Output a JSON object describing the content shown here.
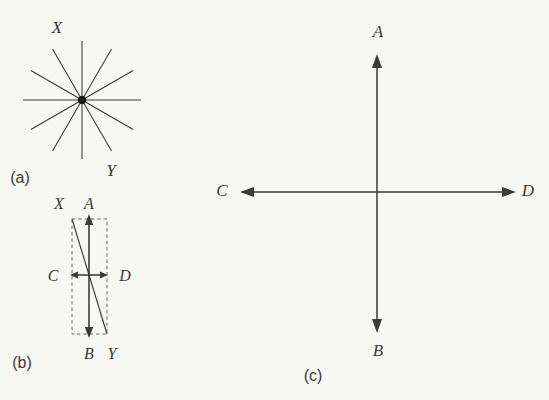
{
  "figure": {
    "width": 549,
    "height": 400,
    "background_color": "#f7f7f4",
    "ink_color": "#3a3a3a",
    "guide_color": "#6b6b6b",
    "hub_color": "#1c1c1c"
  },
  "panels": {
    "a": {
      "caption": "(a)",
      "caption_pos": {
        "x": 20,
        "y": 179
      },
      "type": "radial-starburst",
      "center": {
        "x": 82,
        "y": 100
      },
      "radius": 59,
      "ray_count": 12,
      "ray_angles_deg": [
        0,
        30,
        60,
        90,
        120,
        150,
        180,
        210,
        240,
        270,
        300,
        330
      ],
      "stroke_width": 1.05,
      "hub_radius": 4.2,
      "labels": [
        {
          "name": "X",
          "text": "X",
          "x": 57,
          "y": 29,
          "size": 17
        },
        {
          "name": "Y",
          "text": "Y",
          "x": 111,
          "y": 172,
          "size": 17
        }
      ]
    },
    "b": {
      "caption": "(b)",
      "caption_pos": {
        "x": 22,
        "y": 364
      },
      "type": "vector-resolution",
      "origin": {
        "x": 89,
        "y": 275
      },
      "vertical_axis": {
        "x": 89,
        "top_y": 214,
        "bottom_y": 338
      },
      "horizontal_axis": {
        "y": 275,
        "left_x": 70,
        "right_x": 108
      },
      "diagonal": {
        "x1": 72,
        "y1": 219,
        "x2": 107,
        "y2": 334
      },
      "dashed_rect": {
        "x1": 72,
        "y1": 219,
        "x2": 107,
        "y2": 334
      },
      "stroke_width": 1.6,
      "labels": [
        {
          "name": "X",
          "text": "X",
          "x": 59,
          "y": 205,
          "size": 16
        },
        {
          "name": "A",
          "text": "A",
          "x": 89,
          "y": 205,
          "size": 16
        },
        {
          "name": "C",
          "text": "C",
          "x": 53,
          "y": 277,
          "size": 16
        },
        {
          "name": "D",
          "text": "D",
          "x": 125,
          "y": 277,
          "size": 16
        },
        {
          "name": "B",
          "text": "B",
          "x": 89,
          "y": 355,
          "size": 16
        },
        {
          "name": "Y",
          "text": "Y",
          "x": 112,
          "y": 355,
          "size": 16
        }
      ]
    },
    "c": {
      "caption": "(c)",
      "caption_pos": {
        "x": 313,
        "y": 377
      },
      "type": "cross-axes",
      "center": {
        "x": 377,
        "y": 192
      },
      "vertical_axis": {
        "x": 377,
        "top_y": 54,
        "bottom_y": 333
      },
      "horizontal_axis": {
        "y": 192,
        "left_x": 240,
        "right_x": 516
      },
      "stroke_width": 1.5,
      "labels": [
        {
          "name": "A",
          "text": "A",
          "x": 378,
          "y": 33,
          "size": 17
        },
        {
          "name": "B",
          "text": "B",
          "x": 378,
          "y": 352,
          "size": 17
        },
        {
          "name": "C",
          "text": "C",
          "x": 222,
          "y": 192,
          "size": 17
        },
        {
          "name": "D",
          "text": "D",
          "x": 528,
          "y": 192,
          "size": 17
        }
      ]
    }
  },
  "chart_data": {
    "type": "diagram",
    "panel_count": 3,
    "panels": [
      {
        "id": "a",
        "caption": "(a)",
        "description": "Unpolarized light represented by 12 vibration directions radiating from a common point",
        "vector_count": 12,
        "annotations": [
          "X",
          "Y"
        ]
      },
      {
        "id": "b",
        "caption": "(b)",
        "description": "Resolution of the XY vibration into vertical component AB and horizontal component CD",
        "annotations": [
          "X",
          "A",
          "C",
          "D",
          "B",
          "Y"
        ],
        "components": [
          {
            "name": "AB",
            "orientation": "vertical",
            "relative_magnitude": 1.0
          },
          {
            "name": "CD",
            "orientation": "horizontal",
            "relative_magnitude": 0.31
          },
          {
            "name": "XY",
            "orientation": "diagonal",
            "relative_magnitude": 1.05
          }
        ]
      },
      {
        "id": "c",
        "caption": "(c)",
        "description": "Net resultant: two mutually perpendicular plane-polarized directions AB and CD",
        "annotations": [
          "A",
          "B",
          "C",
          "D"
        ],
        "components": [
          {
            "name": "AB",
            "orientation": "vertical",
            "relative_magnitude": 1.0
          },
          {
            "name": "CD",
            "orientation": "horizontal",
            "relative_magnitude": 0.99
          }
        ]
      }
    ]
  }
}
